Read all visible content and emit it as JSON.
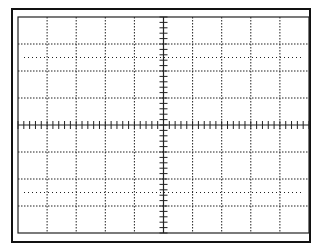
{
  "graticule": {
    "columns": 10,
    "rows": 8,
    "minor_ticks_per_division": 5,
    "line_color": "#222222",
    "background": "#ffffff",
    "dotted_reference_rows": [
      1.5,
      6.5
    ]
  }
}
